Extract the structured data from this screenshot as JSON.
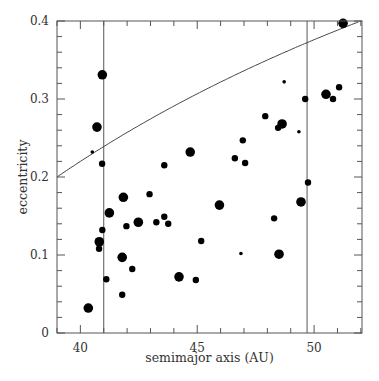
{
  "chart_data": {
    "type": "scatter",
    "title": "",
    "xlabel": "semimajor axis (AU)",
    "ylabel": "eccentricity",
    "xlim": [
      39.0,
      52.05
    ],
    "ylim": [
      0,
      0.4
    ],
    "xticks": [
      40,
      45,
      50
    ],
    "xtick_labels": [
      "40",
      "45",
      "50"
    ],
    "yticks": [
      0,
      0.1,
      0.2,
      0.3,
      0.4
    ],
    "ytick_labels": [
      "0",
      "0.1",
      "0.2",
      "0.3",
      "0.4"
    ],
    "x_minor_step": 1,
    "y_minor_step": 0.02,
    "grid": false,
    "legend": null,
    "vertical_lines": [
      41.0,
      49.7
    ],
    "curve": {
      "description": "constant perihelion curve e = 1 - q/a",
      "q": 31.2
    },
    "marker_color": "#000000",
    "points": [
      {
        "a": 40.94,
        "e": 0.331,
        "size": "large"
      },
      {
        "a": 40.71,
        "e": 0.264,
        "size": "large"
      },
      {
        "a": 40.51,
        "e": 0.232,
        "size": "tiny"
      },
      {
        "a": 40.93,
        "e": 0.217,
        "size": "small"
      },
      {
        "a": 41.84,
        "e": 0.174,
        "size": "large"
      },
      {
        "a": 42.96,
        "e": 0.178,
        "size": "small"
      },
      {
        "a": 41.24,
        "e": 0.154,
        "size": "large"
      },
      {
        "a": 41.97,
        "e": 0.137,
        "size": "small"
      },
      {
        "a": 42.48,
        "e": 0.142,
        "size": "large"
      },
      {
        "a": 43.25,
        "e": 0.142,
        "size": "small"
      },
      {
        "a": 43.59,
        "e": 0.149,
        "size": "small"
      },
      {
        "a": 43.76,
        "e": 0.14,
        "size": "small"
      },
      {
        "a": 43.59,
        "e": 0.215,
        "size": "small"
      },
      {
        "a": 40.94,
        "e": 0.132,
        "size": "small"
      },
      {
        "a": 40.81,
        "e": 0.117,
        "size": "large"
      },
      {
        "a": 40.8,
        "e": 0.108,
        "size": "small"
      },
      {
        "a": 41.79,
        "e": 0.097,
        "size": "large"
      },
      {
        "a": 42.22,
        "e": 0.082,
        "size": "small"
      },
      {
        "a": 41.11,
        "e": 0.069,
        "size": "small"
      },
      {
        "a": 41.79,
        "e": 0.049,
        "size": "small"
      },
      {
        "a": 40.34,
        "e": 0.032,
        "size": "large"
      },
      {
        "a": 44.22,
        "e": 0.072,
        "size": "large"
      },
      {
        "a": 44.94,
        "e": 0.068,
        "size": "small"
      },
      {
        "a": 45.17,
        "e": 0.118,
        "size": "small"
      },
      {
        "a": 44.7,
        "e": 0.232,
        "size": "large"
      },
      {
        "a": 45.95,
        "e": 0.164,
        "size": "large"
      },
      {
        "a": 46.61,
        "e": 0.224,
        "size": "small"
      },
      {
        "a": 46.95,
        "e": 0.247,
        "size": "small"
      },
      {
        "a": 47.05,
        "e": 0.218,
        "size": "small"
      },
      {
        "a": 46.87,
        "e": 0.102,
        "size": "tiny"
      },
      {
        "a": 47.91,
        "e": 0.278,
        "size": "small"
      },
      {
        "a": 48.29,
        "e": 0.147,
        "size": "small"
      },
      {
        "a": 48.46,
        "e": 0.263,
        "size": "small"
      },
      {
        "a": 48.63,
        "e": 0.268,
        "size": "large"
      },
      {
        "a": 48.5,
        "e": 0.101,
        "size": "large"
      },
      {
        "a": 48.72,
        "e": 0.322,
        "size": "tiny"
      },
      {
        "a": 49.35,
        "e": 0.258,
        "size": "tiny"
      },
      {
        "a": 49.44,
        "e": 0.168,
        "size": "large"
      },
      {
        "a": 49.62,
        "e": 0.3,
        "size": "small"
      },
      {
        "a": 49.74,
        "e": 0.193,
        "size": "small"
      },
      {
        "a": 50.51,
        "e": 0.306,
        "size": "large"
      },
      {
        "a": 50.81,
        "e": 0.3,
        "size": "small"
      },
      {
        "a": 51.07,
        "e": 0.315,
        "size": "small"
      },
      {
        "a": 51.24,
        "e": 0.397,
        "size": "large"
      }
    ]
  },
  "layout": {
    "plot_left": 57,
    "plot_right": 362,
    "plot_top": 21,
    "plot_bottom": 333,
    "marker_radius": {
      "tiny": 1.8,
      "small": 3.2,
      "large": 4.8
    },
    "frame_color": "#555555"
  }
}
